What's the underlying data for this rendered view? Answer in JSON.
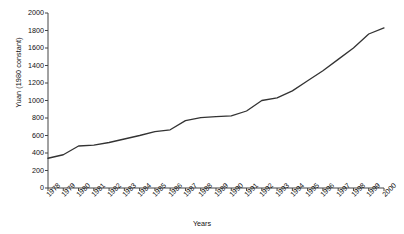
{
  "chart_data": {
    "type": "line",
    "title": "",
    "xlabel": "Years",
    "ylabel": "Yuan (1980 constant)",
    "ylim": [
      0,
      2000
    ],
    "ytick_values": [
      0,
      200,
      400,
      600,
      800,
      1000,
      1200,
      1400,
      1600,
      1800,
      2000
    ],
    "ytick_labels": [
      "0",
      "200",
      "400",
      "600",
      "800",
      "1000",
      "1200",
      "1400",
      "1600",
      "1800",
      "2000"
    ],
    "grid": false,
    "legend": null,
    "line_color": "#333333",
    "categories": [
      "1978",
      "1979",
      "1980",
      "1981",
      "1982",
      "1983",
      "1984",
      "1985",
      "1986",
      "1987",
      "1988",
      "1989",
      "1990",
      "1991",
      "1992",
      "1993",
      "1994",
      "1995",
      "1996",
      "1997",
      "1998",
      "1999",
      "2000"
    ],
    "values": [
      340,
      380,
      480,
      490,
      520,
      560,
      600,
      645,
      665,
      770,
      805,
      815,
      825,
      880,
      1000,
      1030,
      1110,
      1225,
      1340,
      1470,
      1600,
      1760,
      1830
    ]
  }
}
